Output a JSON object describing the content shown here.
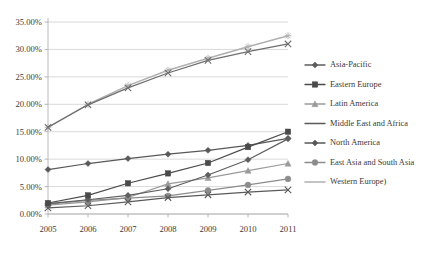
{
  "chart_data": {
    "type": "line",
    "title": "",
    "subtitle": "",
    "xlabel": "",
    "ylabel": "",
    "x": [
      2005,
      2006,
      2007,
      2008,
      2009,
      2010,
      2011
    ],
    "categories": [
      "2005",
      "2006",
      "2007",
      "2008",
      "2009",
      "2010",
      "2011"
    ],
    "xtick_labels": [
      "2005",
      "2006",
      "2007",
      "2008",
      "2009",
      "2010",
      "2011"
    ],
    "ytick_labels": [
      "0.00%",
      "5.00%",
      "10.00%",
      "15.00%",
      "20.00%",
      "25.00%",
      "30.00%",
      "35.00%"
    ],
    "ytick_values": [
      0,
      5,
      10,
      15,
      20,
      25,
      30,
      35
    ],
    "ylim": [
      0,
      35
    ],
    "xlim": [
      2005,
      2011
    ],
    "grid": true,
    "legend_position": "right",
    "value_suffix": "%",
    "series": [
      {
        "name": "Asia-Pacific",
        "marker": "diamond",
        "color": "#5e5e5e",
        "values": [
          1.9,
          2.6,
          3.4,
          4.6,
          7.1,
          9.9,
          13.7
        ]
      },
      {
        "name": "Eastern Europe",
        "marker": "square",
        "color": "#4a4a4a",
        "values": [
          2.0,
          3.4,
          5.6,
          7.4,
          9.3,
          12.2,
          15.0
        ]
      },
      {
        "name": "Latin America",
        "marker": "triangle",
        "color": "#9a9a9a",
        "values": [
          1.6,
          2.2,
          3.0,
          5.5,
          6.6,
          7.9,
          9.2
        ]
      },
      {
        "name": "Middle East and Africa",
        "marker": "x",
        "color": "#5a5a5a",
        "values": [
          1.1,
          1.5,
          2.2,
          3.0,
          3.5,
          4.0,
          4.4
        ]
      },
      {
        "name": "North America",
        "marker": "diamond",
        "color": "#585858",
        "values": [
          8.1,
          9.2,
          10.1,
          10.9,
          11.6,
          12.5,
          13.8
        ]
      },
      {
        "name": "East Asia and South Asia",
        "marker": "circle",
        "color": "#8c8c8c",
        "values": [
          1.8,
          2.5,
          2.9,
          3.3,
          4.3,
          5.3,
          6.4
        ]
      },
      {
        "name": "Western Europe)",
        "marker": "asterisk",
        "color": "#b0b0b0",
        "values": [
          15.8,
          20.0,
          23.4,
          26.2,
          28.4,
          30.5,
          32.5
        ]
      }
    ],
    "upper_pair_note": "North America and Western Europe) overlap in the upper band",
    "second_upper": {
      "name": "North America upper track",
      "marker": "x",
      "color": "#6e6e6e",
      "values": [
        15.8,
        19.9,
        23.0,
        25.7,
        28.0,
        29.6,
        31.0
      ]
    }
  },
  "legend": {
    "items": [
      {
        "label": "Asia-Pacific"
      },
      {
        "label": "Eastern Europe"
      },
      {
        "label": "Latin America"
      },
      {
        "label": "Middle East and Africa"
      },
      {
        "label": "North America"
      },
      {
        "label": "East Asia and South Asia"
      },
      {
        "label": "Western Europe)"
      }
    ]
  }
}
